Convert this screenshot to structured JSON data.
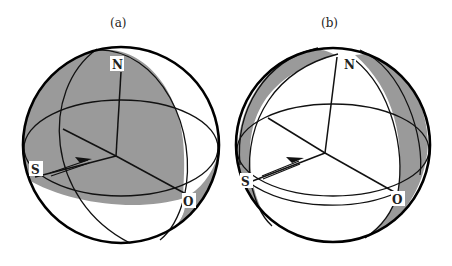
{
  "figure": {
    "panels": [
      {
        "id": "a",
        "caption": "(a)",
        "labels": {
          "north": "N",
          "south": "S",
          "origin": "O"
        },
        "shading": "hemisphere-shaded",
        "shade_color": "#9a9a9a"
      },
      {
        "id": "b",
        "caption": "(b)",
        "labels": {
          "north": "N",
          "south": "S",
          "origin": "O"
        },
        "shading": "lune-bands-shaded",
        "shade_color": "#9a9a9a"
      }
    ],
    "line_color": "#111111",
    "background": "#ffffff"
  }
}
